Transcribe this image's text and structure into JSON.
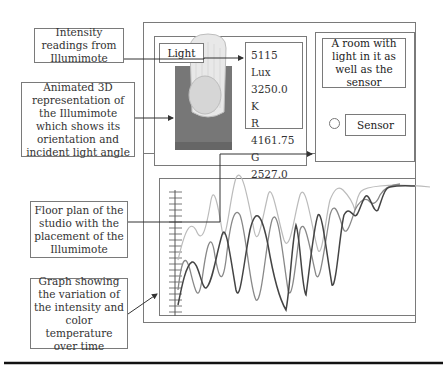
{
  "callouts": {
    "intensity": "Intensity readings from Illumimote",
    "animated3d": "Animated 3D representation of the Illumimote which shows its orientation and incident light angle",
    "floorplan": "Floor plan of the studio with the placement of the Illumimote",
    "graph": "Graph showing the variation of the intensity and color temperature over time"
  },
  "viewer": {
    "light_label": "Light",
    "readings": [
      {
        "label": "5115 Lux"
      },
      {
        "label": "3250.0 K"
      },
      {
        "label": "R 4161.75"
      },
      {
        "label": "G 2527.0"
      },
      {
        "label": "B 1227.75"
      }
    ]
  },
  "room": {
    "caption": "A room with light in it as well as the sensor",
    "sensor_label": "Sensor"
  },
  "colors": {
    "border": "#7a7a7a",
    "device_base": "#777777",
    "line_dark": "#444444",
    "line_mid": "#888888",
    "line_light": "#bbbbbb"
  }
}
